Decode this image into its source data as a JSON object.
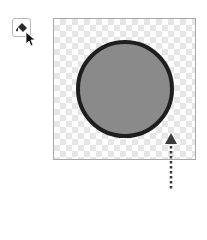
{
  "toolbar": {
    "fill_tool": {
      "icon": "paint-bucket-icon",
      "state": "hovered"
    }
  },
  "canvas": {
    "background": "transparent-checkerboard",
    "shape": {
      "type": "circle",
      "fill": "#8a8a8a",
      "stroke": "#1e1e1e"
    }
  },
  "annotation": {
    "icon": "dotted-arrow-up-icon",
    "color": "#3a3a3a"
  }
}
